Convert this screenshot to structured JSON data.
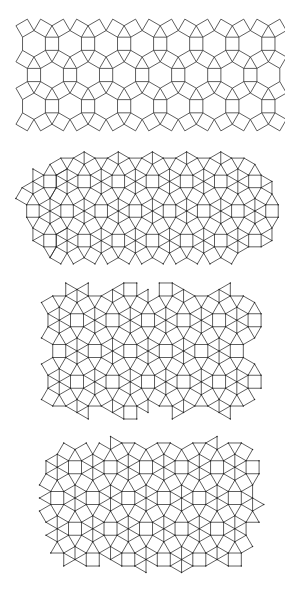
{
  "figure": {
    "panels": [
      {
        "id": "panel-1",
        "kind": "rhombitrihexagonal",
        "top": 24,
        "height": 102,
        "edge": 13.2,
        "origin": [
          52,
          75
        ],
        "clip": {
          "type": "rect",
          "x": 16,
          "y": 24,
          "w": 266,
          "h": 101
        },
        "subdivide_hexagons": false,
        "dots": false
      },
      {
        "id": "panel-2",
        "kind": "rhombitrihexagonal",
        "top": 157,
        "height": 102,
        "edge": 12.5,
        "origin": [
          50,
          211
        ],
        "clip": {
          "type": "stadium",
          "x": 23,
          "y": 157,
          "w": 254,
          "h": 102
        },
        "subdivide_hexagons": true,
        "dots": true
      },
      {
        "id": "panel-3",
        "kind": "rhombitrihexagonal",
        "top": 290,
        "height": 120,
        "edge": 13.0,
        "origin": [
          77,
          351
        ],
        "clip": {
          "type": "blob",
          "x": 53,
          "y": 290,
          "w": 195,
          "h": 121,
          "cols": 4,
          "rows": 2
        },
        "subdivide_hexagons": true,
        "dots": true
      },
      {
        "id": "panel-4",
        "kind": "rhombitrihexagonal",
        "top": 443,
        "height": 125,
        "edge": 13.0,
        "origin": [
          75,
          498
        ],
        "clip": {
          "type": "blob4",
          "x": 45,
          "y": 443,
          "w": 212,
          "h": 125
        },
        "subdivide_hexagons": true,
        "dots": true
      }
    ],
    "line_color": "#2a2a2a",
    "background": "#ffffff"
  }
}
